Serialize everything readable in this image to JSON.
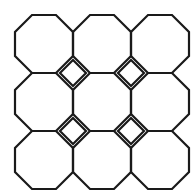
{
  "figure": {
    "canvas": {
      "width": 194,
      "height": 194,
      "background_color": "#ffffff"
    },
    "style": {
      "stroke_color": "#1a1a1a",
      "stroke_width": 2.2,
      "fill": "none"
    },
    "geometry": {
      "tiling_name": "4.8.8",
      "octagon_rows": 3,
      "octagon_columns": 3,
      "octagon_count": 9,
      "square_count": 4,
      "pitch_x": 58,
      "pitch_y": 58,
      "octagon_width": 58,
      "octagon_flat_edge_length": 24,
      "octagon_bevel": 17,
      "square_diagonal": 26,
      "bounds": {
        "left": 15,
        "top": 15,
        "right": 189,
        "bottom": 189
      },
      "octagon_centers_x": [
        44,
        102,
        160
      ],
      "octagon_centers_y": [
        44,
        102,
        160
      ],
      "square_centers_x": [
        73,
        131
      ],
      "square_centers_y": [
        73,
        131
      ]
    },
    "shapes": {
      "octagons": [
        {
          "name": "octagon-r1-c1",
          "cx": 44,
          "cy": 44
        },
        {
          "name": "octagon-r1-c2",
          "cx": 102,
          "cy": 44
        },
        {
          "name": "octagon-r1-c3",
          "cx": 160,
          "cy": 44
        },
        {
          "name": "octagon-r2-c1",
          "cx": 44,
          "cy": 102
        },
        {
          "name": "octagon-r2-c2",
          "cx": 102,
          "cy": 102
        },
        {
          "name": "octagon-r2-c3",
          "cx": 160,
          "cy": 102
        },
        {
          "name": "octagon-r3-c1",
          "cx": 44,
          "cy": 160
        },
        {
          "name": "octagon-r3-c2",
          "cx": 102,
          "cy": 160
        },
        {
          "name": "octagon-r3-c3",
          "cx": 160,
          "cy": 160
        }
      ],
      "squares": [
        {
          "name": "square-r1-c1",
          "cx": 73,
          "cy": 73
        },
        {
          "name": "square-r1-c2",
          "cx": 131,
          "cy": 73
        },
        {
          "name": "square-r2-c1",
          "cx": 73,
          "cy": 131
        },
        {
          "name": "square-r2-c2",
          "cx": 131,
          "cy": 131
        }
      ]
    }
  }
}
